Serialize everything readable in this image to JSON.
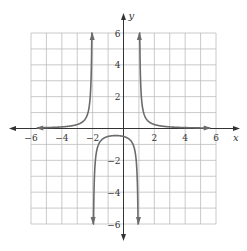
{
  "chart_data": {
    "type": "line",
    "title": "",
    "xlabel": "x",
    "ylabel": "y",
    "xlim": [
      -6,
      6
    ],
    "ylim": [
      -6,
      6
    ],
    "grid": true,
    "grid_step": 1,
    "x_ticks": [
      -6,
      -4,
      -2,
      2,
      4,
      6
    ],
    "y_ticks": [
      6,
      4,
      2,
      -2,
      -4,
      -6
    ],
    "x_tick_labels": [
      "−6",
      "−4",
      "−2",
      "2",
      "4",
      "6"
    ],
    "y_tick_labels": [
      "6",
      "4",
      "2",
      "−2",
      "−4",
      "−6"
    ],
    "function": "y = 1/((x+2)(x-1))",
    "vertical_asymptotes": [
      -2,
      1
    ],
    "horizontal_asymptote": 0,
    "series": [
      {
        "name": "left branch",
        "x": [
          -6,
          -5,
          -4,
          -3,
          -2.5,
          -2.2,
          -2.1,
          -2.05
        ],
        "y": [
          0.036,
          0.056,
          0.1,
          0.25,
          0.571,
          1.563,
          3.226,
          6.56
        ]
      },
      {
        "name": "middle branch",
        "x": [
          -1.95,
          -1.9,
          -1.5,
          -1,
          -0.5,
          0,
          0.5,
          0.9,
          0.95
        ],
        "y": [
          -6.9,
          -3.45,
          -0.8,
          -0.5,
          -0.444,
          -0.5,
          -0.8,
          -3.45,
          -6.9
        ]
      },
      {
        "name": "right branch",
        "x": [
          1.05,
          1.1,
          1.5,
          2,
          3,
          4,
          5,
          6
        ],
        "y": [
          6.56,
          3.226,
          0.571,
          0.25,
          0.1,
          0.056,
          0.036,
          0.025
        ]
      }
    ],
    "colors": {
      "curve": "#6b6b6b",
      "grid": "#bdbdbd",
      "axis": "#333333"
    }
  }
}
